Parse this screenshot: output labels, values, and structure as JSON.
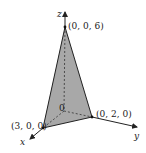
{
  "diagram": {
    "type": "3d-tetrahedron",
    "axes": {
      "x": "x",
      "y": "y",
      "z": "z"
    },
    "origin_label": "0",
    "vertices": [
      {
        "id": "apex",
        "label": "(0, 0, 6)"
      },
      {
        "id": "x-int",
        "label": "(3, 0, 0)"
      },
      {
        "id": "y-int",
        "label": "(0, 2, 0)"
      }
    ],
    "colors": {
      "face_fill": "#aaaaaa",
      "stroke": "#222222",
      "background": "#ffffff"
    }
  }
}
